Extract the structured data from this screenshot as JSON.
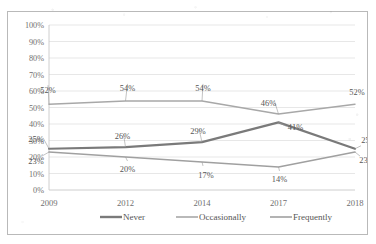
{
  "chart_data": {
    "type": "line",
    "title": "",
    "subtitle": "",
    "xlabel": "",
    "ylabel": "",
    "categories": [
      "2009",
      "2012",
      "2014",
      "2017",
      "2018"
    ],
    "x": [
      "2009",
      "2012",
      "2014",
      "2017",
      "2018"
    ],
    "ylim": [
      0,
      100
    ],
    "ytick_labels": [
      "100%",
      "90%",
      "80%",
      "70%",
      "60%",
      "50%",
      "40%",
      "30%",
      "20%",
      "10%",
      "0%"
    ],
    "ytick_values": [
      100,
      90,
      80,
      70,
      60,
      50,
      40,
      30,
      20,
      10,
      0
    ],
    "grid": true,
    "grid_axis": "y",
    "legend_position": "bottom",
    "value_labels": true,
    "value_label_suffix": "%",
    "series": [
      {
        "name": "Never",
        "color": "#7a7a7a",
        "width": 2.2,
        "values": [
          25,
          26,
          29,
          41,
          25
        ],
        "labels": [
          "25%",
          "26%",
          "29%",
          "41%",
          "25%"
        ]
      },
      {
        "name": "Occasionally",
        "color": "#a8a8a8",
        "width": 1.5,
        "values": [
          52,
          54,
          54,
          46,
          52
        ],
        "labels": [
          "52%",
          "54%",
          "54%",
          "46%",
          "52%"
        ]
      },
      {
        "name": "Frequently",
        "color": "#a0a0a0",
        "width": 1.5,
        "values": [
          23,
          20,
          17,
          14,
          23
        ],
        "labels": [
          "23%",
          "20%",
          "17%",
          "14%",
          "23%"
        ]
      }
    ]
  },
  "legend": {
    "items": [
      {
        "label": "Never",
        "color": "#7a7a7a",
        "width": 2.4
      },
      {
        "label": "Occasionally",
        "color": "#a8a8a8",
        "width": 1.6
      },
      {
        "label": "Frequently",
        "color": "#a0a0a0",
        "width": 1.6
      }
    ]
  }
}
